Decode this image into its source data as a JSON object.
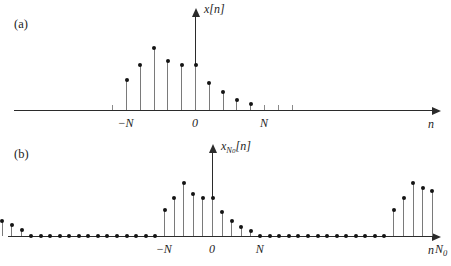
{
  "figure": {
    "caption_a": "(a)",
    "caption_b": "(b)"
  },
  "panel_a": {
    "label": "(a)",
    "y_axis_label": "x[n]",
    "x_axis_label": "n",
    "tick_labels": [
      {
        "text": "-N",
        "value": -5
      },
      {
        "text": "0",
        "value": 0
      },
      {
        "text": "N",
        "value": 5
      }
    ]
  },
  "panel_b": {
    "label": "(b)",
    "y_axis_label_main": "x",
    "y_axis_label_sub": "N",
    "y_axis_label_subsub": "0",
    "y_axis_label_tail": "[n]",
    "x_axis_label": "n",
    "tick_labels": [
      {
        "text": "-N",
        "sub": "0",
        "value": -24
      },
      {
        "text": "-N",
        "sub": "",
        "value": -5
      },
      {
        "text": "0",
        "sub": "",
        "value": 0
      },
      {
        "text": "N",
        "sub": "",
        "value": 5
      },
      {
        "text": "N",
        "sub": "0",
        "value": 24
      }
    ]
  },
  "chart_data": {
    "type": "line",
    "xlabel": "n",
    "ylabel": "x[n]",
    "charts": [
      {
        "id": "panel-a",
        "type": "bar",
        "subtitle": "(a) aperiodic pulse x[n]",
        "xlabel": "n",
        "ylabel": "x[n]",
        "xlim": [
          -12,
          16
        ],
        "ylim": [
          0,
          1.05
        ],
        "x": [
          -5,
          -4,
          -3,
          -2,
          -1,
          0,
          1,
          2,
          3,
          4
        ],
        "values": [
          0.42,
          0.62,
          0.86,
          0.68,
          0.62,
          0.62,
          0.38,
          0.25,
          0.14,
          0.08
        ],
        "nonzero_range": [
          -5,
          4
        ],
        "grid": false,
        "legend": false
      },
      {
        "id": "panel-b",
        "type": "bar",
        "subtitle": "(b) periodic extension x_{N0}[n] with period N0",
        "xlabel": "n",
        "ylabel": "x_{N0}[n]",
        "xlim": [
          -33,
          17
        ],
        "ylim": [
          0,
          1.05
        ],
        "period_N0": 24,
        "pulse_half_width_N": 5,
        "x": [
          -29,
          -28,
          -27,
          -26,
          -25,
          -24,
          -23,
          -22,
          -21,
          -20,
          -5,
          -4,
          -3,
          -2,
          -1,
          0,
          1,
          2,
          3,
          4,
          19,
          20,
          21,
          22,
          23,
          24,
          25,
          26,
          27,
          28
        ],
        "values": [
          0.42,
          0.62,
          0.86,
          0.78,
          0.62,
          0.5,
          0.35,
          0.25,
          0.18,
          0.1,
          0.42,
          0.62,
          0.86,
          0.68,
          0.62,
          0.62,
          0.38,
          0.25,
          0.14,
          0.08,
          0.42,
          0.62,
          0.86,
          0.78,
          0.72,
          0.5,
          0.35,
          0.25,
          0.18,
          0.1
        ],
        "zero_samples_note": "samples between pulses are zero and drawn as dots on the n-axis",
        "grid": false,
        "legend": false
      }
    ]
  },
  "colors": {
    "axis": "#2b2b2b",
    "stem_line": "#7a7a7a",
    "stem_dot": "#141414",
    "background": "#ffffff",
    "text": "#1d1d1d"
  }
}
